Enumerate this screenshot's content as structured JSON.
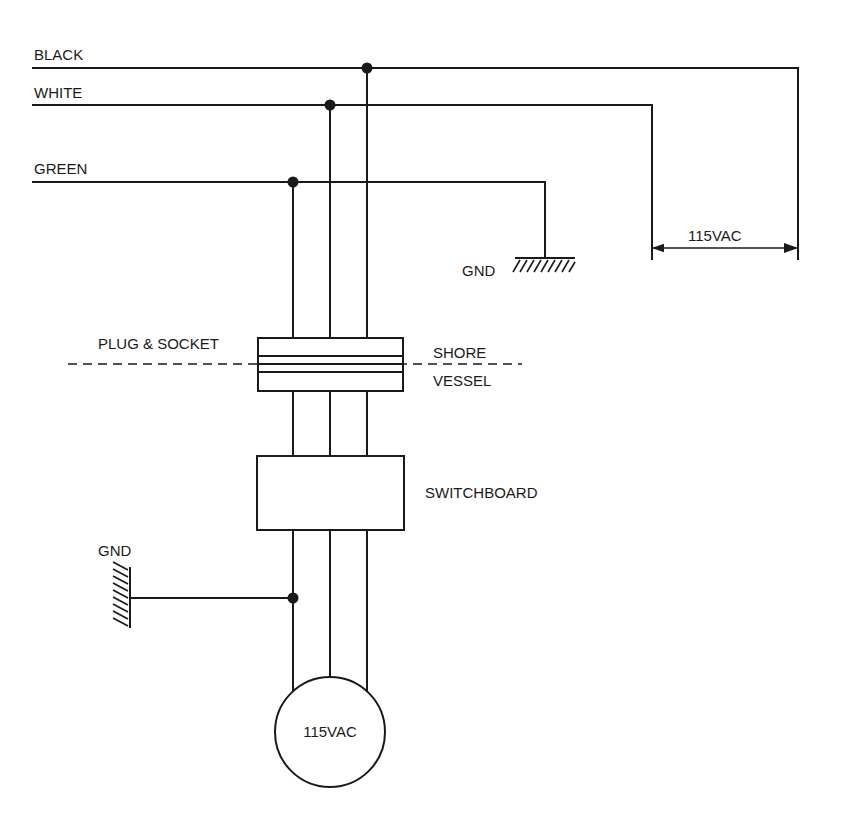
{
  "diagram": {
    "type": "electrical-schematic",
    "wires": [
      {
        "label": "BLACK",
        "y": 68,
        "tap_x": 367,
        "end_x": 798
      },
      {
        "label": "WHITE",
        "y": 105,
        "tap_x": 330,
        "end_x": 652
      },
      {
        "label": "GREEN",
        "y": 182,
        "tap_x": 293,
        "end_x": 545
      }
    ],
    "shore_ground_label": "GND",
    "supply_voltage_label": "115VAC",
    "plug_socket_label": "PLUG & SOCKET",
    "boundary_labels": {
      "upper": "SHORE",
      "lower": "VESSEL"
    },
    "switchboard_label": "SWITCHBOARD",
    "vessel_ground_label": "GND",
    "load_label": "115VAC"
  },
  "colors": {
    "line": "#1a1a1a",
    "background": "#ffffff"
  }
}
